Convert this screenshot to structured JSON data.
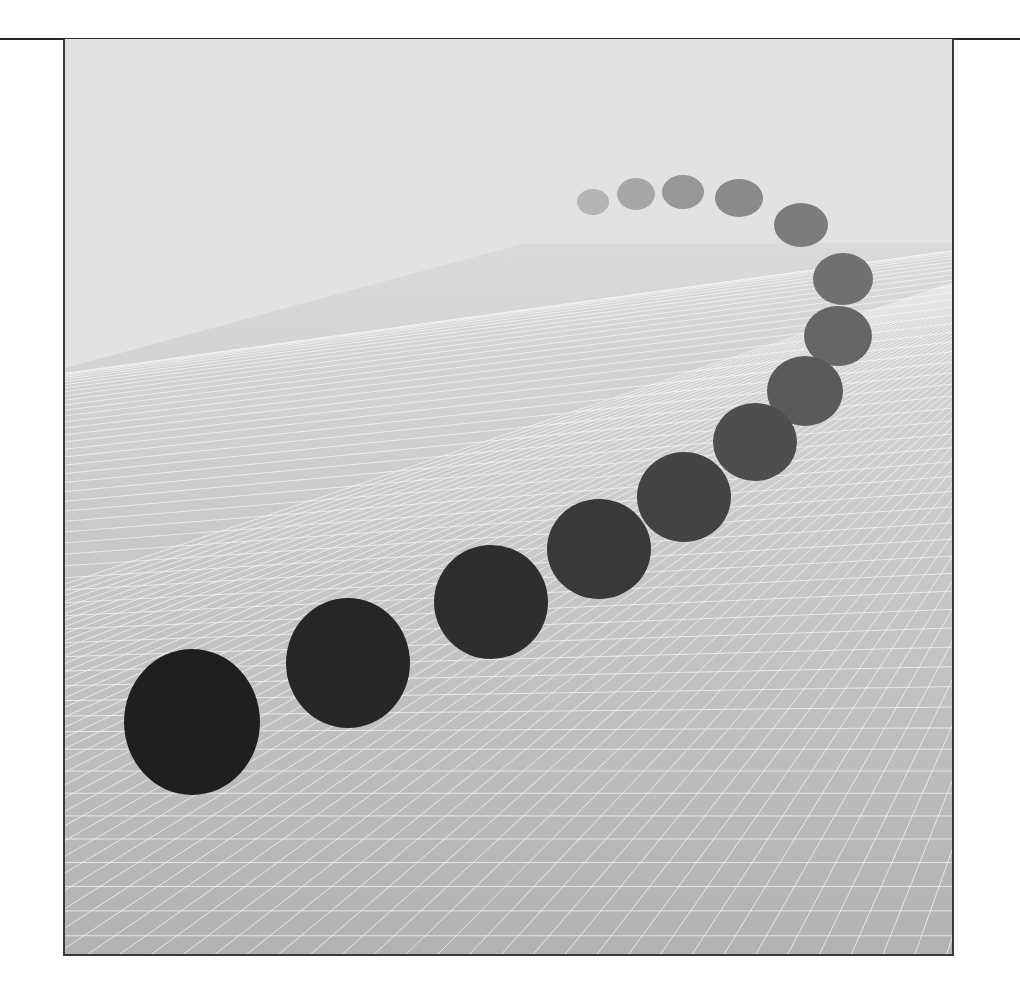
{
  "figure": {
    "frame": {
      "x": 63,
      "y": 39,
      "width": 891,
      "height": 917
    },
    "colors": {
      "sky": "#e2e2e2",
      "floor_far": "#dadada",
      "floor_near": "#b2b2b2",
      "grid_line": "#f4f4f4",
      "frame_border": "#3a3a3a"
    },
    "horizon": {
      "left_x": 63,
      "left_y": 368,
      "right_x": 954,
      "right_y": 243,
      "start_x": 520
    },
    "dots": [
      {
        "id": 1,
        "cx": 591,
        "cy": 202,
        "rx": 16,
        "ry": 13,
        "color": "#b5b5b5"
      },
      {
        "id": 2,
        "cx": 634,
        "cy": 194,
        "rx": 19,
        "ry": 16,
        "color": "#a6a6a6"
      },
      {
        "id": 3,
        "cx": 681,
        "cy": 192,
        "rx": 21,
        "ry": 17,
        "color": "#979797"
      },
      {
        "id": 4,
        "cx": 737,
        "cy": 198,
        "rx": 24,
        "ry": 19,
        "color": "#8a8a8a"
      },
      {
        "id": 5,
        "cx": 799,
        "cy": 225,
        "rx": 27,
        "ry": 22,
        "color": "#7c7c7c"
      },
      {
        "id": 6,
        "cx": 841,
        "cy": 279,
        "rx": 30,
        "ry": 26,
        "color": "#707070"
      },
      {
        "id": 7,
        "cx": 836,
        "cy": 336,
        "rx": 34,
        "ry": 30,
        "color": "#666666"
      },
      {
        "id": 8,
        "cx": 803,
        "cy": 391,
        "rx": 38,
        "ry": 35,
        "color": "#5a5a5a"
      },
      {
        "id": 9,
        "cx": 753,
        "cy": 442,
        "rx": 42,
        "ry": 39,
        "color": "#4e4e4e"
      },
      {
        "id": 10,
        "cx": 682,
        "cy": 497,
        "rx": 47,
        "ry": 45,
        "color": "#434343"
      },
      {
        "id": 11,
        "cx": 597,
        "cy": 549,
        "rx": 52,
        "ry": 50,
        "color": "#393939"
      },
      {
        "id": 12,
        "cx": 489,
        "cy": 602,
        "rx": 57,
        "ry": 57,
        "color": "#2e2e2e"
      },
      {
        "id": 13,
        "cx": 346,
        "cy": 663,
        "rx": 62,
        "ry": 65,
        "color": "#262626"
      },
      {
        "id": 14,
        "cx": 190,
        "cy": 722,
        "rx": 68,
        "ry": 73,
        "color": "#1f1f1f"
      }
    ]
  }
}
